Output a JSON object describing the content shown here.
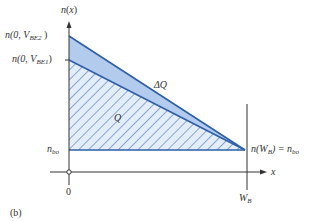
{
  "figure": {
    "panel_label": "(b)",
    "y_axis": {
      "label_fn": "n",
      "label_arg": "x"
    },
    "x_axis": {
      "label": "x",
      "origin_label": "0",
      "end_label_main": "W",
      "end_label_sub": "B"
    },
    "labels": {
      "vbe2": {
        "pre": "n(0, V",
        "sub": "BE2",
        "post": " )"
      },
      "vbe1": {
        "pre": "n(0, V",
        "sub": "BE1",
        "post": ")"
      },
      "nbo": {
        "main": "n",
        "sub": "bo"
      },
      "nwb": {
        "pre": "n(W",
        "sub": "B",
        "mid": ") = n",
        "sub2": "bo"
      },
      "delta_q": "ΔQ",
      "q": "Q"
    },
    "colors": {
      "line": "#2e5fa8",
      "delta_fill": "#b3cbec",
      "q_fill": "#e4eefa",
      "hatch": "#2e5fa8",
      "axis": "#333333"
    }
  }
}
